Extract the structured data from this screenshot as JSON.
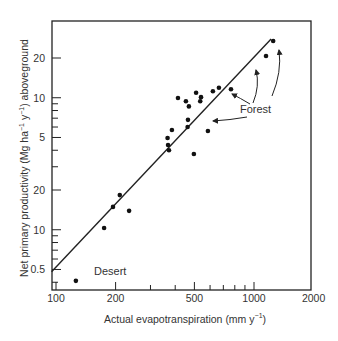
{
  "chart_data": {
    "type": "scatter",
    "title": "",
    "xlabel": "Actual evapotranspiration (mm y-1)",
    "ylabel": "Net primary productivity (Mg ha-1 y-1) aboveground",
    "xscale": "log",
    "yscale": "log",
    "xlim": [
      100,
      2000
    ],
    "ylim": [
      0.33,
      40
    ],
    "grid": false,
    "legend": null,
    "x_ticks": [
      {
        "value": 100,
        "label": "100"
      },
      {
        "value": 200,
        "label": "200"
      },
      {
        "value": 500,
        "label": "500"
      },
      {
        "value": 1000,
        "label": "1000"
      },
      {
        "value": 2000,
        "label": "2000"
      }
    ],
    "x_minor_ticks": [
      300,
      400,
      600,
      700,
      800,
      900
    ],
    "y_ticks": [
      {
        "value": 20,
        "label": "20"
      },
      {
        "value": 10,
        "label": "10"
      },
      {
        "value": 5,
        "label": "5"
      },
      {
        "value": 2,
        "label": "20"
      },
      {
        "value": 1,
        "label": "10"
      },
      {
        "value": 0.5,
        "label": "0.5"
      }
    ],
    "y_minor_ticks": [
      9,
      8,
      7,
      6,
      4,
      3,
      0.9,
      0.8,
      0.7,
      0.6,
      0.4
    ],
    "series": [
      {
        "name": "Sites",
        "points": [
          {
            "x": 126,
            "y": 0.41
          },
          {
            "x": 175,
            "y": 1.03
          },
          {
            "x": 194,
            "y": 1.49
          },
          {
            "x": 210,
            "y": 1.83
          },
          {
            "x": 234,
            "y": 1.39
          },
          {
            "x": 366,
            "y": 4.96
          },
          {
            "x": 368,
            "y": 4.39
          },
          {
            "x": 372,
            "y": 4.0
          },
          {
            "x": 385,
            "y": 5.7
          },
          {
            "x": 413,
            "y": 9.96
          },
          {
            "x": 453,
            "y": 9.4
          },
          {
            "x": 469,
            "y": 8.6
          },
          {
            "x": 464,
            "y": 6.8
          },
          {
            "x": 462,
            "y": 6.0
          },
          {
            "x": 497,
            "y": 3.75
          },
          {
            "x": 510,
            "y": 10.9
          },
          {
            "x": 540,
            "y": 10.1
          },
          {
            "x": 535,
            "y": 9.4
          },
          {
            "x": 585,
            "y": 5.6
          },
          {
            "x": 620,
            "y": 11.2
          },
          {
            "x": 665,
            "y": 11.9
          },
          {
            "x": 765,
            "y": 11.6
          },
          {
            "x": 1150,
            "y": 20.7
          },
          {
            "x": 1250,
            "y": 26.9
          }
        ]
      }
    ],
    "fit_line": {
      "x": [
        95,
        1220
      ],
      "y": [
        0.48,
        27.9
      ]
    },
    "annotations": [
      {
        "text": "Desert",
        "x": 150,
        "y": 0.5
      },
      {
        "text": "Forest",
        "x": 900,
        "y": 7.5,
        "arrows_to": [
          [
            1150,
            20
          ],
          [
            780,
            14
          ],
          [
            770,
            11.5
          ],
          [
            590,
            6
          ]
        ]
      }
    ]
  },
  "labels": {
    "x_axis_main": "Actual evapotranspiration (mm y",
    "x_axis_sup": "−1",
    "x_axis_end": ")",
    "y_axis_a": "Net primary productivity (Mg ha",
    "y_axis_sup1": "−1",
    "y_axis_b": " y",
    "y_axis_sup2": "−1",
    "y_axis_c": ") aboveground",
    "desert": "Desert",
    "forest": "Forest"
  }
}
